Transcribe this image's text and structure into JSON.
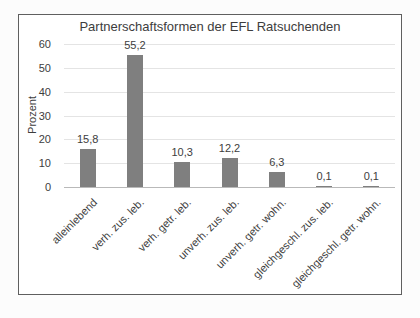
{
  "chart_data": {
    "type": "bar",
    "title": "Partnerschaftsformen der EFL Ratsuchenden",
    "xlabel": "",
    "ylabel": "Prozent",
    "categories": [
      "alleinlebend",
      "verh. zus. leb.",
      "verh. getr. leb.",
      "unverh. zus. leb.",
      "unverh. getr. wohn.",
      "gleichgeschl. zus. leb.",
      "gleichgeschl. getr. wohn."
    ],
    "values": [
      15.8,
      55.2,
      10.3,
      12.2,
      6.3,
      0.1,
      0.1
    ],
    "value_labels": [
      "15,8",
      "55,2",
      "10,3",
      "12,2",
      "6,3",
      "0,1",
      "0,1"
    ],
    "yticks": [
      0,
      10,
      20,
      30,
      40,
      50,
      60
    ],
    "ylim": [
      0,
      60
    ],
    "grid": true,
    "legend": false,
    "bar_color": "#7f7f7f",
    "gridline_color": "#e4e4e4",
    "axis_line_color": "#b9b9b9",
    "text_color": "#3d3d3d"
  }
}
